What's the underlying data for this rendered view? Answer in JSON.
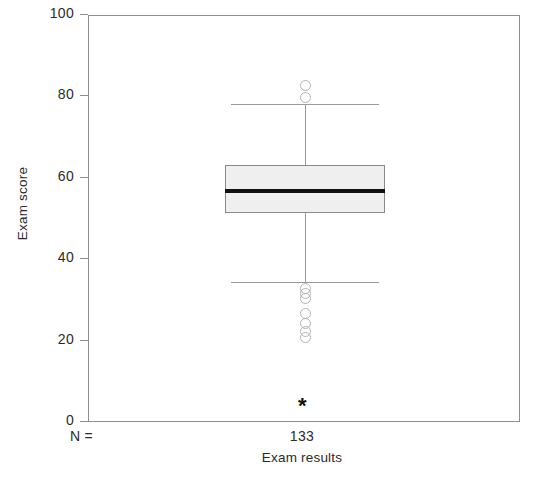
{
  "chart_data": {
    "type": "box",
    "title": "",
    "xlabel": "Exam results",
    "ylabel": "Exam score",
    "ylim": [
      0,
      100
    ],
    "yticks": [
      0,
      20,
      40,
      60,
      80,
      100
    ],
    "ytick_labels": [
      "0",
      "20",
      "40",
      "60",
      "80",
      "100"
    ],
    "grid": false,
    "legend": null,
    "n_label": "N =",
    "categories": [
      "Exam results"
    ],
    "counts": [
      "133"
    ],
    "boxes": [
      {
        "category": "Exam results",
        "n": 133,
        "whisker_low": 34.6,
        "q1": 51.7,
        "median": 57.0,
        "q3": 63.5,
        "whisker_high": 78.5,
        "outliers": [
          83.0,
          80.0,
          33.0,
          31.8,
          30.5,
          27.0,
          24.5,
          22.5,
          21.0
        ],
        "extreme_outliers": [
          4.0
        ]
      }
    ],
    "colors": {
      "box_fill": "#efefef",
      "box_edge": "#8a8a8a",
      "median": "#111111",
      "whisker": "#9a9a9a",
      "outlier_edge": "#b4b4b4",
      "extreme_marker": "#111111",
      "frame": "#8d8d8d",
      "text": "#2b2b2b"
    },
    "markers": {
      "outlier_glyph": "circle-open",
      "extreme_glyph": "asterisk"
    }
  },
  "axes": {
    "y_label": "Exam score",
    "x_label": "Exam results",
    "y_ticks": [
      {
        "label": "100",
        "value": 100
      },
      {
        "label": "80",
        "value": 80
      },
      {
        "label": "60",
        "value": 60
      },
      {
        "label": "40",
        "value": 40
      },
      {
        "label": "20",
        "value": 20
      },
      {
        "label": "0",
        "value": 0
      }
    ]
  },
  "annotations": {
    "n_equals": "N =",
    "count": "133"
  }
}
